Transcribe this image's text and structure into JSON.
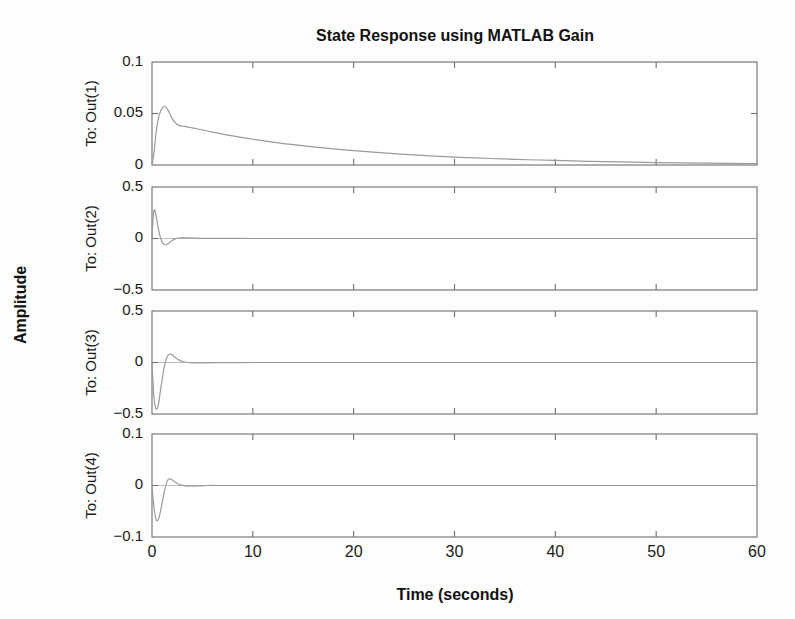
{
  "figure": {
    "title": "State Response using MATLAB Gain",
    "xlabel": "Time (seconds)",
    "ylabel": "Amplitude",
    "background_color": "#fdfdfd",
    "axis_color": "#6e6e6e",
    "line_color": "#9a9a9a",
    "text_color": "#1a1a1a"
  },
  "xticks": [
    "0",
    "10",
    "20",
    "30",
    "40",
    "50",
    "60"
  ],
  "subplots": [
    {
      "row_label": "To: Out(1)",
      "yticks": [
        "0.1",
        "0.05",
        "0"
      ]
    },
    {
      "row_label": "To: Out(2)",
      "yticks": [
        "0.5",
        "0",
        "-0.5"
      ]
    },
    {
      "row_label": "To: Out(3)",
      "yticks": [
        "0.5",
        "0",
        "-0.5"
      ]
    },
    {
      "row_label": "To: Out(4)",
      "yticks": [
        "0.1",
        "0",
        "-0.1"
      ]
    }
  ],
  "chart_data": {
    "type": "line",
    "title": "State Response using MATLAB Gain",
    "xlabel": "Time (seconds)",
    "ylabel": "Amplitude",
    "xlim": [
      0,
      60
    ],
    "xticks": [
      0,
      10,
      20,
      30,
      40,
      50,
      60
    ],
    "grid": false,
    "legend": "none",
    "layout": "4 stacked subplots sharing the x-axis",
    "series": [
      {
        "name": "To: Out(1)",
        "ylim": [
          0,
          0.1
        ],
        "yticks": [
          0,
          0.05,
          0.1
        ],
        "x": [
          0,
          0.2,
          0.4,
          0.6,
          0.8,
          1.0,
          1.2,
          1.4,
          1.6,
          1.8,
          2.0,
          2.4,
          2.8,
          3.2,
          3.6,
          4.0,
          5.0,
          6.0,
          7.0,
          8.0,
          9.0,
          10.0,
          12.0,
          14.0,
          16.0,
          18.0,
          20.0,
          24.0,
          28.0,
          32.0,
          36.0,
          40.0,
          45.0,
          50.0,
          55.0,
          60.0
        ],
        "y": [
          0.0,
          0.012,
          0.031,
          0.044,
          0.051,
          0.055,
          0.057,
          0.056,
          0.053,
          0.049,
          0.045,
          0.04,
          0.038,
          0.0375,
          0.0368,
          0.036,
          0.034,
          0.032,
          0.03,
          0.0282,
          0.0266,
          0.025,
          0.0222,
          0.0197,
          0.0175,
          0.0156,
          0.0139,
          0.011,
          0.0087,
          0.0069,
          0.0055,
          0.0044,
          0.0032,
          0.0024,
          0.0018,
          0.0013
        ]
      },
      {
        "name": "To: Out(2)",
        "ylim": [
          -0.5,
          0.5
        ],
        "yticks": [
          -0.5,
          0,
          0.5
        ],
        "x": [
          0,
          0.1,
          0.2,
          0.3,
          0.45,
          0.6,
          0.8,
          1.0,
          1.2,
          1.4,
          1.6,
          1.8,
          2.0,
          2.3,
          2.6,
          3.0,
          3.5,
          4.0,
          5.0,
          6.0,
          8.0,
          10.0,
          15.0,
          20.0,
          30.0,
          40.0,
          50.0,
          60.0
        ],
        "y": [
          0.0,
          0.18,
          0.275,
          0.265,
          0.195,
          0.11,
          0.02,
          -0.035,
          -0.058,
          -0.06,
          -0.05,
          -0.035,
          -0.02,
          -0.004,
          0.005,
          0.008,
          0.007,
          0.005,
          0.002,
          0.001,
          0.0005,
          0.0002,
          0.0,
          0.0,
          0.0,
          0.0,
          0.0,
          0.0
        ]
      },
      {
        "name": "To: Out(3)",
        "ylim": [
          -0.5,
          0.5
        ],
        "yticks": [
          -0.5,
          0,
          0.5
        ],
        "x": [
          0,
          0.1,
          0.2,
          0.35,
          0.5,
          0.65,
          0.8,
          1.0,
          1.2,
          1.4,
          1.6,
          1.8,
          2.0,
          2.3,
          2.6,
          3.0,
          3.5,
          4.0,
          5.0,
          6.0,
          8.0,
          10.0,
          15.0,
          20.0,
          30.0,
          40.0,
          50.0,
          60.0
        ],
        "y": [
          0.0,
          -0.19,
          -0.34,
          -0.44,
          -0.45,
          -0.4,
          -0.3,
          -0.17,
          -0.05,
          0.03,
          0.072,
          0.082,
          0.075,
          0.05,
          0.028,
          0.01,
          0.0,
          -0.004,
          -0.004,
          -0.002,
          -0.001,
          0.0,
          0.0,
          0.0,
          0.0,
          0.0,
          0.0,
          0.0
        ]
      },
      {
        "name": "To: Out(4)",
        "ylim": [
          -0.1,
          0.1
        ],
        "yticks": [
          -0.1,
          0,
          0.1
        ],
        "x": [
          0,
          0.1,
          0.25,
          0.4,
          0.55,
          0.7,
          0.9,
          1.1,
          1.3,
          1.5,
          1.7,
          1.9,
          2.2,
          2.5,
          2.9,
          3.3,
          3.8,
          4.5,
          5.5,
          7.0,
          9.0,
          12.0,
          16.0,
          20.0,
          30.0,
          40.0,
          50.0,
          60.0
        ],
        "y": [
          0.0,
          -0.024,
          -0.05,
          -0.066,
          -0.068,
          -0.062,
          -0.045,
          -0.024,
          -0.005,
          0.008,
          0.013,
          0.012,
          0.008,
          0.004,
          0.001,
          -0.001,
          -0.001,
          -0.001,
          0.0,
          0.0,
          0.0,
          0.0,
          0.0,
          0.0,
          0.0,
          0.0,
          0.0,
          0.0
        ]
      }
    ]
  }
}
